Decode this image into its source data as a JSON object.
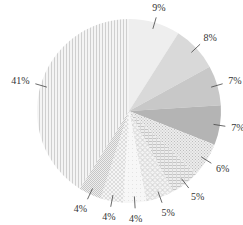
{
  "chart_data": {
    "type": "pie",
    "title": "",
    "start_angle_deg": 0,
    "direction": "clockwise",
    "center": [
      129,
      111
    ],
    "radius": 92,
    "slices": [
      {
        "label": "9%",
        "value": 9,
        "fill": "#eeeeee",
        "pattern": "solid"
      },
      {
        "label": "8%",
        "value": 8,
        "fill": "#d9d9d9",
        "pattern": "solid"
      },
      {
        "label": "7%",
        "value": 7,
        "fill": "#c8c8c8",
        "pattern": "solid"
      },
      {
        "label": "7%",
        "value": 7,
        "fill": "#b4b4b4",
        "pattern": "solid"
      },
      {
        "label": "6%",
        "value": 6,
        "fill": "#e2e2e2",
        "pattern": "fine-dots"
      },
      {
        "label": "5%",
        "value": 5,
        "fill": "#dcdcdc",
        "pattern": "horizontal-lines"
      },
      {
        "label": "5%",
        "value": 5,
        "fill": "#e6e6e6",
        "pattern": "diamond-grid"
      },
      {
        "label": "4%",
        "value": 4,
        "fill": "#f2f2f2",
        "pattern": "light"
      },
      {
        "label": "4%",
        "value": 4,
        "fill": "#ebebeb",
        "pattern": "cross-hatch"
      },
      {
        "label": "4%",
        "value": 4,
        "fill": "#e0e0e0",
        "pattern": "checker"
      },
      {
        "label": "41%",
        "value": 41,
        "fill": "#ececec",
        "pattern": "vertical-lines"
      }
    ],
    "legend": null
  }
}
